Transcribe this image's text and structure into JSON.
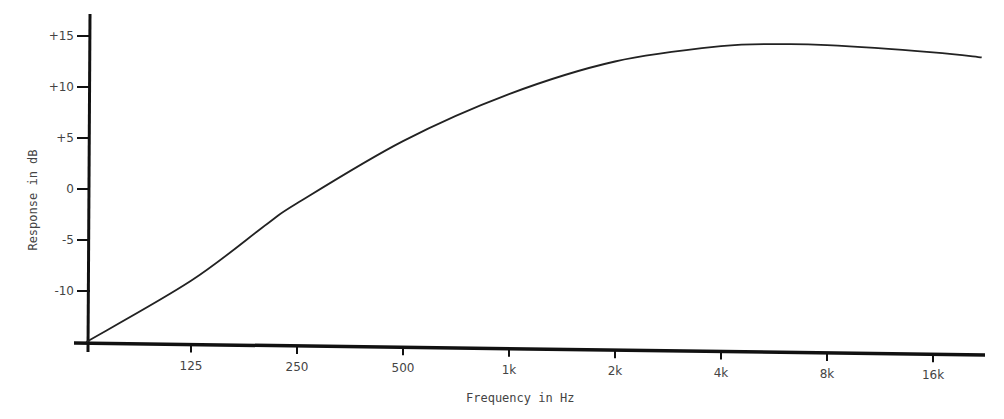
{
  "chart_data": {
    "type": "line",
    "title": "",
    "xlabel": "Frequency in Hz",
    "ylabel": "Response in dB",
    "x_scale": "log2",
    "x_ticks": [
      "125",
      "250",
      "500",
      "1k",
      "2k",
      "4k",
      "8k",
      "16k"
    ],
    "x_tick_values": [
      125,
      250,
      500,
      1000,
      2000,
      4000,
      8000,
      16000
    ],
    "y_ticks": [
      "+15",
      "+10",
      "+5",
      "0",
      "-5",
      "-10"
    ],
    "y_tick_values": [
      15,
      10,
      5,
      0,
      -5,
      -10
    ],
    "ylim": [
      -15,
      16.5
    ],
    "xlim": [
      50,
      22000
    ],
    "grid": false,
    "legend": null,
    "series": [
      {
        "name": "Response",
        "x": [
          63,
          125,
          206,
          250,
          500,
          1000,
          2000,
          4000,
          5900,
          8000,
          16000,
          22000
        ],
        "values": [
          -15,
          -9,
          -3.4,
          -1.4,
          4.7,
          9.3,
          12.5,
          14.0,
          14.2,
          14.1,
          13.4,
          12.9
        ]
      }
    ]
  }
}
